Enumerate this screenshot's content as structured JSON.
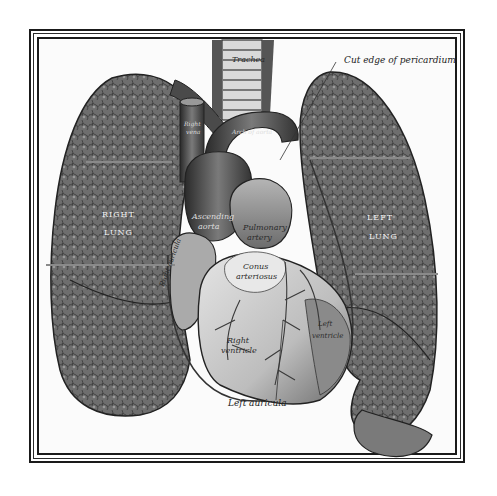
{
  "figure": {
    "frame_color": "#1a1a1a",
    "background": "#ffffff",
    "labels": {
      "trachea": "Trachea",
      "pericardium": "Cut edge of pericardium",
      "right_lung_1": "RIGHT",
      "right_lung_2": "LUNG",
      "left_lung_1": "LEFT",
      "left_lung_2": "LUNG",
      "ascending_aorta_1": "Ascending",
      "ascending_aorta_2": "aorta",
      "pulmonary_artery_1": "Pulmonary",
      "pulmonary_artery_2": "artery",
      "conus_1": "Conus",
      "conus_2": "arteriosus",
      "right_auricula": "Right auricula",
      "right_ventricle_1": "Right",
      "right_ventricle_2": "ventricle",
      "left_ventricle_1": "Left",
      "left_ventricle_2": "ventricle",
      "left_auricula": "Left auricula",
      "svc_1": "Right",
      "svc_2": "vena",
      "arch": "Arch of aorta"
    }
  }
}
